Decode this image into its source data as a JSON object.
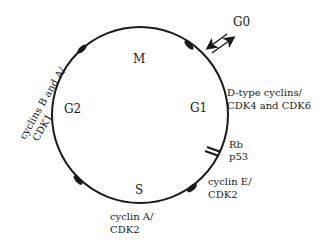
{
  "diagram": {
    "phases": {
      "M": "M",
      "G1": "G1",
      "S": "S",
      "G2": "G2",
      "G0": "G0"
    },
    "labels": {
      "g1_line1": "D-type cyclins/",
      "g1_line2": "CDK4 and CDK6",
      "checkpoint_line1": "Rb",
      "checkpoint_line2": "p53",
      "g1s_line1": "cyclin E/",
      "g1s_line2": "CDK2",
      "s_line1": "cyclin A/",
      "s_line2": "CDK2",
      "g2m_line1": "cyclins B and A/",
      "g2m_line2": "CDK1"
    },
    "colors": {
      "line": "#1a1a1a",
      "background": "#ffffff"
    }
  }
}
